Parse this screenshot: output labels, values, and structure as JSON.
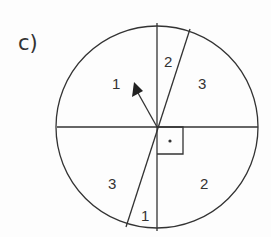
{
  "figure": {
    "part_label": "c)",
    "circle": {
      "cx": 157,
      "cy": 127,
      "r": 101
    },
    "regions": [
      {
        "label": "1",
        "x": 112,
        "y": 89
      },
      {
        "label": "2",
        "x": 164,
        "y": 67
      },
      {
        "label": "3",
        "x": 201,
        "y": 89
      },
      {
        "label": "3",
        "x": 111,
        "y": 188
      },
      {
        "label": "2",
        "x": 205,
        "y": 188
      },
      {
        "label": "1",
        "x": 143,
        "y": 218
      }
    ],
    "colors": {
      "stroke": "#333333",
      "background": "#fdfdfd"
    }
  }
}
